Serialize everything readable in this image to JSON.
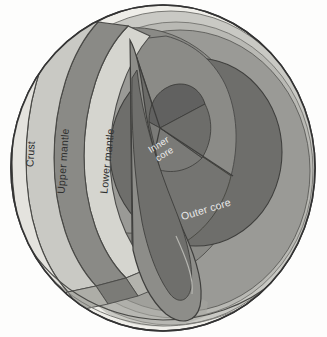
{
  "diagram": {
    "background_color": "#fdfdfc",
    "outline_color": "#3a3a3a"
  },
  "labels": {
    "crust": "Crust",
    "upper_mantle": "Upper mantle",
    "lower_mantle": "Lower mantle",
    "inner_core_line1": "Inner",
    "inner_core_line2": "core",
    "outer_core": "Outer core"
  },
  "layers": [
    {
      "name": "crust",
      "label": "Crust",
      "color": "#efeee9",
      "shade_color": "#d9d8d2"
    },
    {
      "name": "upper-mantle",
      "label": "Upper mantle",
      "color": "#c9c9c4",
      "shade_color": "#b2b2ad"
    },
    {
      "name": "transition-band",
      "label": "",
      "color": "#8a8a86",
      "shade_color": "#797975"
    },
    {
      "name": "lower-mantle",
      "label": "Lower mantle",
      "color": "#d5d5cf",
      "shade_color": "#b9b9b3"
    },
    {
      "name": "outer-core",
      "label": "Outer core",
      "color": "#6e6e6b",
      "shade_color": "#5d5d5a"
    },
    {
      "name": "inner-core",
      "label": "Inner core",
      "color": "#636360",
      "shade_color": "#8f8f8b"
    }
  ],
  "palette": {
    "sphere_body": "#9a9a96",
    "sphere_body_light": "#b5b5b0",
    "continent_shadow": "#9d9d98",
    "cut_face_dark": "#7d7d79",
    "cut_face_mid": "#a2a29d",
    "label_dark": "#2f2f2f",
    "label_light": "#e9e9e9"
  }
}
